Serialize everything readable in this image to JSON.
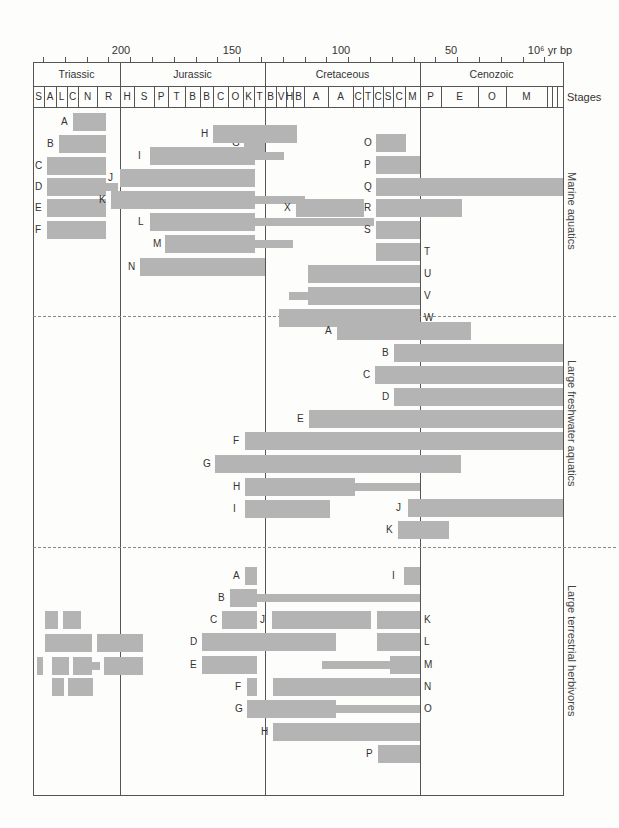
{
  "chart_data": {
    "type": "range-bar",
    "title": "",
    "xlabel": "10⁶ yr bp",
    "x_ticks": [
      {
        "value": 200,
        "label": "200"
      },
      {
        "value": 150,
        "label": "150"
      },
      {
        "value": 100,
        "label": "100"
      },
      {
        "value": 50,
        "label": "50"
      },
      {
        "value": 10,
        "label": "10⁶ yr bp"
      }
    ],
    "periods": [
      {
        "name": "Triassic",
        "x0": 33,
        "x1": 120
      },
      {
        "name": "Jurassic",
        "x0": 120,
        "x1": 265
      },
      {
        "name": "Cretaceous",
        "x0": 265,
        "x1": 420
      },
      {
        "name": "Cenozoic",
        "x0": 420,
        "x1": 563
      }
    ],
    "stages_label": "Stages",
    "stages": [
      {
        "name": "S",
        "x0": 33,
        "x1": 44
      },
      {
        "name": "A",
        "x0": 44,
        "x1": 56
      },
      {
        "name": "L",
        "x0": 56,
        "x1": 67
      },
      {
        "name": "C",
        "x0": 67,
        "x1": 78
      },
      {
        "name": "N",
        "x0": 78,
        "x1": 97
      },
      {
        "name": "R",
        "x0": 97,
        "x1": 120
      },
      {
        "name": "H",
        "x0": 120,
        "x1": 134
      },
      {
        "name": "S",
        "x0": 134,
        "x1": 154
      },
      {
        "name": "P",
        "x0": 154,
        "x1": 168
      },
      {
        "name": "T",
        "x0": 168,
        "x1": 185
      },
      {
        "name": "B",
        "x0": 185,
        "x1": 200
      },
      {
        "name": "B",
        "x0": 200,
        "x1": 213
      },
      {
        "name": "C",
        "x0": 213,
        "x1": 228
      },
      {
        "name": "O",
        "x0": 228,
        "x1": 243
      },
      {
        "name": "K",
        "x0": 243,
        "x1": 254
      },
      {
        "name": "T",
        "x0": 254,
        "x1": 265
      },
      {
        "name": "B",
        "x0": 265,
        "x1": 276
      },
      {
        "name": "V",
        "x0": 276,
        "x1": 286
      },
      {
        "name": "H",
        "x0": 286,
        "x1": 293
      },
      {
        "name": "B",
        "x0": 293,
        "x1": 304
      },
      {
        "name": "A",
        "x0": 304,
        "x1": 328
      },
      {
        "name": "A",
        "x0": 328,
        "x1": 353
      },
      {
        "name": "C",
        "x0": 353,
        "x1": 363
      },
      {
        "name": "T",
        "x0": 363,
        "x1": 373
      },
      {
        "name": "C",
        "x0": 373,
        "x1": 383
      },
      {
        "name": "S",
        "x0": 383,
        "x1": 393
      },
      {
        "name": "C",
        "x0": 393,
        "x1": 405
      },
      {
        "name": "M",
        "x0": 405,
        "x1": 420
      },
      {
        "name": "P",
        "x0": 420,
        "x1": 441
      },
      {
        "name": "E",
        "x0": 441,
        "x1": 478
      },
      {
        "name": "O",
        "x0": 478,
        "x1": 506
      },
      {
        "name": "M",
        "x0": 506,
        "x1": 547
      },
      {
        "name": "",
        "x0": 547,
        "x1": 552
      },
      {
        "name": "",
        "x0": 552,
        "x1": 557
      },
      {
        "name": "",
        "x0": 557,
        "x1": 563
      }
    ],
    "groups": [
      {
        "name": "Marine aquatics",
        "bars": [
          {
            "label": "A",
            "label_side": "left",
            "y": 122,
            "segments": [
              [
                73,
                106,
                "thick"
              ]
            ]
          },
          {
            "label": "B",
            "label_side": "left",
            "y": 144,
            "segments": [
              [
                59,
                106,
                "thick"
              ]
            ]
          },
          {
            "label": "C",
            "label_side": "left",
            "y": 166,
            "segments": [
              [
                47,
                106,
                "thick"
              ]
            ]
          },
          {
            "label": "D",
            "label_side": "left",
            "y": 187,
            "segments": [
              [
                47,
                106,
                "thick"
              ],
              [
                106,
                118,
                "thin"
              ]
            ]
          },
          {
            "label": "E",
            "label_side": "left",
            "y": 208,
            "segments": [
              [
                47,
                106,
                "thick"
              ]
            ]
          },
          {
            "label": "F",
            "label_side": "left",
            "y": 230,
            "segments": [
              [
                47,
                106,
                "thick"
              ]
            ]
          },
          {
            "label": "G",
            "label_side": "left",
            "y": 143,
            "segments": [
              [
                244,
                265,
                "thick"
              ]
            ]
          },
          {
            "label": "H",
            "label_side": "left",
            "y": 134,
            "segments": [
              [
                213,
                297,
                "thick"
              ]
            ]
          },
          {
            "label": "I",
            "label_side": "left",
            "y": 156,
            "segments": [
              [
                150,
                255,
                "thick"
              ],
              [
                255,
                284,
                "thin"
              ]
            ]
          },
          {
            "label": "J",
            "label_side": "left",
            "y": 178,
            "segments": [
              [
                120,
                255,
                "thick"
              ]
            ]
          },
          {
            "label": "K",
            "label_side": "left",
            "y": 200,
            "segments": [
              [
                111,
                255,
                "thick"
              ],
              [
                255,
                305,
                "thin"
              ]
            ]
          },
          {
            "label": "L",
            "label_side": "left",
            "y": 222,
            "segments": [
              [
                150,
                255,
                "thick"
              ],
              [
                255,
                374,
                "thin"
              ]
            ]
          },
          {
            "label": "M",
            "label_side": "left",
            "y": 244,
            "segments": [
              [
                165,
                255,
                "thick"
              ],
              [
                255,
                293,
                "thin"
              ]
            ]
          },
          {
            "label": "N",
            "label_side": "left",
            "y": 267,
            "segments": [
              [
                140,
                265,
                "thick"
              ]
            ]
          },
          {
            "label": "O",
            "label_side": "left",
            "y": 143,
            "segments": [
              [
                376,
                406,
                "thick"
              ]
            ]
          },
          {
            "label": "P",
            "label_side": "left",
            "y": 165,
            "segments": [
              [
                376,
                420,
                "thick"
              ]
            ]
          },
          {
            "label": "Q",
            "label_side": "left",
            "y": 187,
            "segments": [
              [
                376,
                563,
                "thick"
              ]
            ]
          },
          {
            "label": "R",
            "label_side": "left",
            "y": 208,
            "segments": [
              [
                376,
                462,
                "thick"
              ]
            ]
          },
          {
            "label": "S",
            "label_side": "left",
            "y": 230,
            "segments": [
              [
                376,
                420,
                "thick"
              ]
            ]
          },
          {
            "label": "T",
            "label_side": "right",
            "y": 252,
            "segments": [
              [
                376,
                420,
                "thick"
              ]
            ]
          },
          {
            "label": "U",
            "label_side": "right",
            "y": 274,
            "segments": [
              [
                308,
                420,
                "thick"
              ]
            ]
          },
          {
            "label": "V",
            "label_side": "right",
            "y": 296,
            "segments": [
              [
                289,
                308,
                "thin"
              ],
              [
                308,
                420,
                "thick"
              ]
            ]
          },
          {
            "label": "W",
            "label_side": "right",
            "y": 318,
            "segments": [
              [
                279,
                420,
                "thick"
              ]
            ]
          },
          {
            "label": "X",
            "label_side": "left",
            "y": 208,
            "segments": [
              [
                296,
                364,
                "thick"
              ]
            ]
          }
        ]
      },
      {
        "name": "Large freshwater aquatics",
        "bars": [
          {
            "label": "A",
            "label_side": "left",
            "y": 331,
            "segments": [
              [
                337,
                471,
                "thick"
              ]
            ]
          },
          {
            "label": "B",
            "label_side": "left",
            "y": 353,
            "segments": [
              [
                394,
                563,
                "thick"
              ]
            ]
          },
          {
            "label": "C",
            "label_side": "left",
            "y": 375,
            "segments": [
              [
                375,
                563,
                "thick"
              ]
            ]
          },
          {
            "label": "D",
            "label_side": "left",
            "y": 397,
            "segments": [
              [
                394,
                563,
                "thick"
              ]
            ]
          },
          {
            "label": "E",
            "label_side": "left",
            "y": 419,
            "segments": [
              [
                309,
                563,
                "thick"
              ]
            ]
          },
          {
            "label": "F",
            "label_side": "left",
            "y": 441,
            "segments": [
              [
                245,
                563,
                "thick"
              ]
            ]
          },
          {
            "label": "G",
            "label_side": "left",
            "y": 464,
            "segments": [
              [
                215,
                461,
                "thick"
              ]
            ]
          },
          {
            "label": "H",
            "label_side": "left",
            "y": 487,
            "segments": [
              [
                245,
                355,
                "thick"
              ],
              [
                355,
                420,
                "thin"
              ]
            ]
          },
          {
            "label": "I",
            "label_side": "left",
            "y": 509,
            "segments": [
              [
                245,
                330,
                "thick"
              ]
            ]
          },
          {
            "label": "J",
            "label_side": "left",
            "y": 508,
            "segments": [
              [
                408,
                563,
                "thick"
              ]
            ]
          },
          {
            "label": "K",
            "label_side": "left",
            "y": 530,
            "segments": [
              [
                398,
                449,
                "thick"
              ]
            ]
          }
        ]
      },
      {
        "name": "Large terrestrial herbivores",
        "bars": [
          {
            "label": "A",
            "label_side": "left",
            "y": 576,
            "segments": [
              [
                245,
                257,
                "thick"
              ]
            ]
          },
          {
            "label": "B",
            "label_side": "left",
            "y": 598,
            "segments": [
              [
                230,
                257,
                "thick"
              ],
              [
                257,
                420,
                "thin"
              ]
            ]
          },
          {
            "label": "C",
            "label_side": "left",
            "y": 620,
            "segments": [
              [
                222,
                257,
                "thick"
              ]
            ]
          },
          {
            "label": "D",
            "label_side": "left",
            "y": 642,
            "segments": [
              [
                202,
                336,
                "thick"
              ]
            ]
          },
          {
            "label": "E",
            "label_side": "left",
            "y": 665,
            "segments": [
              [
                202,
                257,
                "thick"
              ]
            ]
          },
          {
            "label": "F",
            "label_side": "left",
            "y": 687,
            "segments": [
              [
                247,
                257,
                "thick"
              ]
            ]
          },
          {
            "label": "G",
            "label_side": "left",
            "y": 709,
            "segments": [
              [
                247,
                336,
                "thick"
              ],
              [
                336,
                420,
                "thin"
              ]
            ]
          },
          {
            "label": "H",
            "label_side": "left",
            "y": 732,
            "segments": [
              [
                273,
                420,
                "thick"
              ]
            ]
          },
          {
            "label": "I",
            "label_side": "left",
            "y": 576,
            "segments": [
              [
                404,
                420,
                "thick"
              ]
            ]
          },
          {
            "label": "J",
            "label_side": "left",
            "y": 620,
            "segments": [
              [
                272,
                371,
                "thick"
              ]
            ]
          },
          {
            "label": "K",
            "label_side": "right",
            "y": 620,
            "segments": [
              [
                377,
                420,
                "thick"
              ]
            ]
          },
          {
            "label": "L",
            "label_side": "right",
            "y": 642,
            "segments": [
              [
                377,
                420,
                "thick"
              ]
            ]
          },
          {
            "label": "M",
            "label_side": "right",
            "y": 665,
            "segments": [
              [
                322,
                390,
                "thin"
              ],
              [
                390,
                420,
                "thick"
              ]
            ]
          },
          {
            "label": "N",
            "label_side": "right",
            "y": 687,
            "segments": [
              [
                273,
                420,
                "thick"
              ]
            ]
          },
          {
            "label": "O",
            "label_side": "right",
            "y": 709,
            "segments": [
              [
                336,
                420,
                "thin"
              ]
            ]
          },
          {
            "label": "P",
            "label_side": "left",
            "y": 754,
            "segments": [
              [
                378,
                420,
                "thick"
              ]
            ]
          },
          {
            "label": "",
            "label_side": "none",
            "y": 620,
            "segments": [
              [
                45,
                58,
                "thick"
              ],
              [
                63,
                81,
                "thick"
              ]
            ]
          },
          {
            "label": "",
            "label_side": "none",
            "y": 643,
            "segments": [
              [
                45,
                92,
                "thick"
              ],
              [
                97,
                143,
                "thick"
              ]
            ]
          },
          {
            "label": "",
            "label_side": "none",
            "y": 666,
            "segments": [
              [
                37,
                43,
                "thick"
              ],
              [
                52,
                69,
                "thick"
              ],
              [
                73,
                92,
                "thick"
              ],
              [
                92,
                100,
                "thin"
              ],
              [
                104,
                143,
                "thick"
              ]
            ]
          },
          {
            "label": "",
            "label_side": "none",
            "y": 687,
            "segments": [
              [
                52,
                64,
                "thick"
              ],
              [
                68,
                93,
                "thick"
              ]
            ]
          }
        ]
      }
    ]
  },
  "axis": {
    "tick_labels": [
      "200",
      "150",
      "100",
      "50",
      "10⁶ yr bp"
    ]
  },
  "periods": [
    "Triassic",
    "Jurassic",
    "Cretaceous",
    "Cenozoic"
  ],
  "stages_label": "Stages",
  "group_labels": [
    "Marine aquatics",
    "Large freshwater aquatics",
    "Large terrestrial herbivores"
  ]
}
